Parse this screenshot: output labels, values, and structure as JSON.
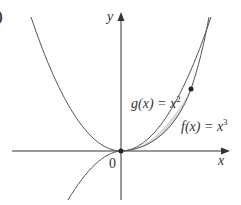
{
  "figure": {
    "panel_label": ")",
    "axes": {
      "x_label": "x",
      "y_label": "y",
      "origin_label": "0"
    },
    "curves": [
      {
        "name": "g",
        "label_prefix": "g(x) = x",
        "exponent": "2",
        "expression": "x^2"
      },
      {
        "name": "f",
        "label_prefix": "f(x) = x",
        "exponent": "3",
        "expression": "x^3"
      }
    ],
    "intersection_points": [
      [
        0,
        0
      ],
      [
        1,
        1
      ]
    ],
    "shaded_region": "between g(x)=x^2 and f(x)=x^3 for 0 <= x <= 1",
    "colors": {
      "curve": "#555555",
      "axis": "#333333",
      "shade": "#d9d9d9",
      "point": "#222222"
    }
  }
}
